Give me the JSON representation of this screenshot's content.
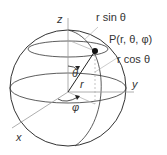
{
  "diagram": {
    "axes": {
      "x": "x",
      "y": "y",
      "z": "z"
    },
    "point_label": "P(r, θ, φ)",
    "labels": {
      "r_sin_theta": "r sin θ",
      "r_cos_theta": "r cos θ",
      "r": "r",
      "theta": "θ",
      "phi": "φ"
    },
    "colors": {
      "line": "#333333",
      "axis": "#999999",
      "guide": "#aaaaaa",
      "point": "#111111"
    }
  }
}
